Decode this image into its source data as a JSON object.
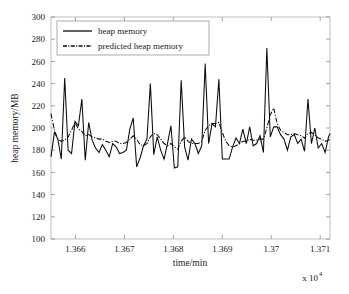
{
  "chart_data": {
    "type": "line",
    "title": "",
    "xlabel": "time/min",
    "ylabel": "heap memory/MB",
    "x_multiplier": "x 10",
    "x_multiplier_exponent": "4",
    "xlim": [
      13655.0,
      13712.0
    ],
    "ylim": [
      100,
      300
    ],
    "xticks": [
      13660,
      13670,
      13680,
      13690,
      13700,
      13710
    ],
    "xticklabels": [
      "1.366",
      "1.367",
      "1.368",
      "1.369",
      "1.37",
      "1.371"
    ],
    "yticks": [
      100,
      120,
      140,
      160,
      180,
      200,
      220,
      240,
      260,
      280,
      300
    ],
    "yticklabels": [
      "100",
      "120",
      "140",
      "160",
      "180",
      "200",
      "220",
      "240",
      "260",
      "280",
      "300"
    ],
    "grid": false,
    "legend_position": "top-left",
    "legend": [
      "heap memory",
      "predicted heap memory"
    ],
    "x": [
      13655.0,
      13655.7,
      13656.4,
      13657.1,
      13657.8,
      13658.5,
      13659.2,
      13659.9,
      13660.6,
      13661.3,
      13662.0,
      13662.7,
      13663.4,
      13664.1,
      13664.8,
      13665.5,
      13666.2,
      13666.9,
      13667.6,
      13668.3,
      13669.0,
      13669.7,
      13670.4,
      13671.1,
      13671.8,
      13672.5,
      13673.2,
      13673.9,
      13674.6,
      13675.3,
      13676.0,
      13676.7,
      13677.4,
      13678.1,
      13678.8,
      13679.5,
      13680.2,
      13680.9,
      13681.6,
      13682.3,
      13683.0,
      13683.7,
      13684.4,
      13685.1,
      13685.8,
      13686.5,
      13687.2,
      13687.9,
      13688.6,
      13689.3,
      13690.0,
      13690.7,
      13691.4,
      13692.1,
      13692.8,
      13693.5,
      13694.2,
      13694.9,
      13695.6,
      13696.3,
      13697.0,
      13697.7,
      13698.4,
      13699.1,
      13699.8,
      13700.5,
      13701.2,
      13701.9,
      13702.6,
      13703.3,
      13704.0,
      13704.7,
      13705.4,
      13706.1,
      13706.8,
      13707.5,
      13708.2,
      13708.9,
      13709.6,
      13710.3,
      13711.0,
      13711.7,
      13712.0
    ],
    "series": [
      {
        "name": "heap memory",
        "style": "solid",
        "values": [
          174,
          196,
          190,
          172,
          245,
          180,
          177,
          206,
          202,
          226,
          171,
          205,
          189,
          182,
          178,
          185,
          180,
          174,
          186,
          183,
          177,
          178,
          180,
          199,
          209,
          165,
          173,
          184,
          190,
          240,
          176,
          192,
          180,
          172,
          186,
          202,
          164,
          165,
          243,
          183,
          171,
          190,
          186,
          177,
          184,
          258,
          186,
          204,
          201,
          244,
          172,
          172,
          172,
          183,
          191,
          186,
          199,
          186,
          201,
          184,
          186,
          193,
          178,
          272,
          192,
          201,
          201,
          194,
          190,
          180,
          192,
          194,
          186,
          190,
          179,
          226,
          186,
          200,
          182,
          186,
          178,
          192,
          195
        ]
      },
      {
        "name": "predicted heap memory",
        "style": "dash-dot",
        "values": [
          213,
          198,
          190,
          188,
          189,
          192,
          198,
          205,
          199,
          197,
          193,
          194,
          192,
          191,
          190,
          190,
          188,
          187,
          188,
          188,
          186,
          186,
          187,
          190,
          193,
          190,
          185,
          184,
          186,
          192,
          195,
          194,
          190,
          186,
          184,
          186,
          183,
          181,
          188,
          192,
          188,
          186,
          186,
          186,
          188,
          198,
          202,
          204,
          204,
          205,
          196,
          188,
          184,
          183,
          184,
          186,
          188,
          188,
          190,
          189,
          189,
          190,
          190,
          200,
          212,
          218,
          204,
          198,
          196,
          194,
          194,
          195,
          194,
          193,
          191,
          195,
          196,
          194,
          191,
          190,
          188,
          189,
          190
        ]
      }
    ]
  },
  "axes": {
    "y_axis_label": "heap memory/MB",
    "x_axis_label": "time/min"
  },
  "legend": {
    "items": [
      {
        "label": "heap memory",
        "style": "solid"
      },
      {
        "label": "predicted heap memory",
        "style": "dash-dot"
      }
    ]
  }
}
